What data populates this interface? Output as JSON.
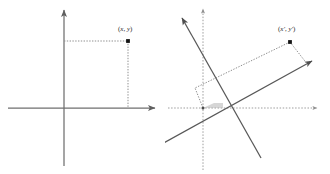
{
  "figure": {
    "type": "diagram",
    "background_color": "#ffffff",
    "axis_color": "#6b6b6b",
    "rotated_axis_color": "#585858",
    "dotted_color": "#9a9a9a",
    "point_color": "#1a1a1a",
    "label_color": "#2b2b2b",
    "panels": [
      {
        "id": "original-axes",
        "name": "Original coordinate system",
        "point_label": "(x, y)",
        "point_label_parts": {
          "open": "(",
          "x": "x",
          "comma": ", ",
          "y": "y",
          "close": ")"
        },
        "axes": [
          {
            "name": "x-axis",
            "direction": "horizontal",
            "arrow": "right"
          },
          {
            "name": "y-axis",
            "direction": "vertical",
            "arrow": "up"
          }
        ],
        "projection_lines": [
          "horizontal-dashed-to-y-axis",
          "vertical-dashed-to-x-axis"
        ],
        "origin": {
          "x": 64,
          "y": 108
        },
        "point": {
          "x": 128,
          "y": 41
        }
      },
      {
        "id": "rotated-axes",
        "name": "Rotated coordinate system",
        "point_label": "(x', y')",
        "point_label_parts": {
          "open": "(",
          "x": "x'",
          "comma": ", ",
          "y": "y'",
          "close": ")"
        },
        "axes": [
          {
            "name": "x-axis",
            "direction": "horizontal",
            "style": "dotted"
          },
          {
            "name": "y-axis",
            "direction": "vertical",
            "style": "dotted"
          },
          {
            "name": "x-prime-axis",
            "direction": "rotated",
            "arrow": "upper-right"
          },
          {
            "name": "y-prime-axis",
            "direction": "rotated",
            "arrow": "upper-left"
          }
        ],
        "angle_marker": true,
        "projection_lines": [
          "dashed-parallelogram-to-rotated-axes"
        ],
        "origin": {
          "x": 38,
          "y": 108
        },
        "point": {
          "x": 125,
          "y": 42
        }
      }
    ]
  }
}
